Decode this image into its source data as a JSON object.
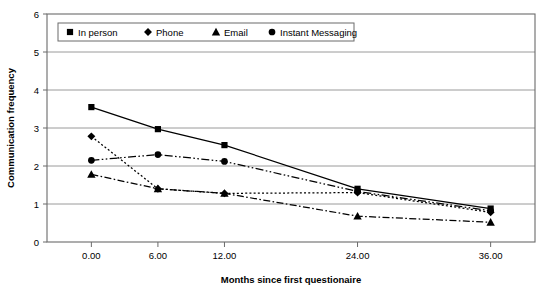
{
  "chart_data": {
    "type": "line",
    "title": "",
    "xlabel": "Months since first questionaire",
    "ylabel": "Communication frequency",
    "x": [
      0,
      6,
      12,
      24,
      36
    ],
    "xtick_labels": [
      "0.00",
      "6.00",
      "12.00",
      "24.00",
      "36.00"
    ],
    "ytick_labels": [
      "0",
      "1",
      "2",
      "3",
      "4",
      "5",
      "6"
    ],
    "xlim": [
      -4,
      40
    ],
    "ylim": [
      0,
      6
    ],
    "grid": "horizontal",
    "legend_position": "top-left-inside",
    "series": [
      {
        "name": "In person",
        "marker": "square",
        "line_style": "solid",
        "color": "#000000",
        "values": [
          3.55,
          2.97,
          2.55,
          1.4,
          0.88
        ]
      },
      {
        "name": "Phone",
        "marker": "diamond",
        "line_style": "dotted",
        "color": "#000000",
        "values": [
          2.78,
          1.4,
          1.28,
          1.3,
          0.78
        ]
      },
      {
        "name": "Email",
        "marker": "triangle",
        "line_style": "dash-dot",
        "color": "#000000",
        "values": [
          1.78,
          1.4,
          1.28,
          0.68,
          0.52
        ]
      },
      {
        "name": "Instant Messaging",
        "marker": "circle",
        "line_style": "dash-dot-dot",
        "color": "#000000",
        "values": [
          2.15,
          2.3,
          2.12,
          1.33,
          0.82
        ]
      }
    ]
  },
  "axes": {
    "y_label": "Communication frequency",
    "x_label": "Months since first questionaire"
  },
  "legend": {
    "items": [
      {
        "label": "In person"
      },
      {
        "label": "Phone"
      },
      {
        "label": "Email"
      },
      {
        "label": "Instant Messaging"
      }
    ]
  },
  "style": {
    "plot_border": "#6b6b6b",
    "gridline": "#9a9a9a",
    "series_color": "#1a1a1a",
    "background": "#ffffff"
  }
}
